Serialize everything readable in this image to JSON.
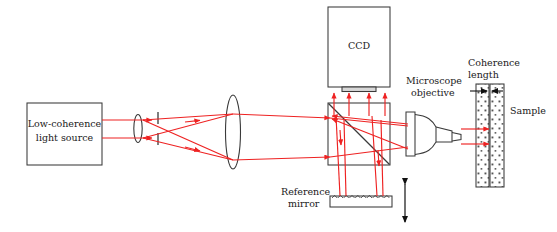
{
  "figure": {
    "type": "optical-schematic",
    "background_color": "#ffffff",
    "ray_color": "#ee2222",
    "outline_color": "#3a3a3a",
    "text_color": "#1a1a1a"
  },
  "labels": {
    "light_source_line1": "Low-coherence",
    "light_source_line2": "light source",
    "ccd": "CCD",
    "microscope_objective_line1": "Microscope",
    "microscope_objective_line2": "objective",
    "coherence_length_line1": "Coherence",
    "coherence_length_line2": "length",
    "sample": "Sample",
    "reference_mirror_line1": "Reference",
    "reference_mirror_line2": "mirror"
  },
  "components": [
    {
      "name": "low-coherence-light-source",
      "kind": "box",
      "x": 27,
      "y": 103,
      "w": 75,
      "h": 62
    },
    {
      "name": "condenser-lens",
      "kind": "lens",
      "cx": 138,
      "cy": 128,
      "rx": 4,
      "ry": 14
    },
    {
      "name": "pinhole-aperture",
      "kind": "aperture",
      "x": 158,
      "cy": 128,
      "gap": 8,
      "h": 30
    },
    {
      "name": "collimating-lens",
      "kind": "lens",
      "cx": 233,
      "cy": 132,
      "rx": 8,
      "ry": 36
    },
    {
      "name": "ccd-camera",
      "kind": "box",
      "x": 328,
      "y": 7,
      "w": 62,
      "h": 80
    },
    {
      "name": "ccd-sensor-element",
      "kind": "bar",
      "x": 341,
      "y": 87,
      "w": 35,
      "h": 5
    },
    {
      "name": "beamsplitter-cube",
      "kind": "cube",
      "x": 328,
      "y": 103,
      "w": 62,
      "h": 62
    },
    {
      "name": "beamsplitter-diagonal",
      "kind": "line",
      "x1": 328,
      "y1": 103,
      "x2": 390,
      "y2": 165
    },
    {
      "name": "microscope-objective",
      "kind": "objective",
      "x": 406,
      "y": 112,
      "w": 55,
      "h": 44
    },
    {
      "name": "sample",
      "kind": "stippled-slab",
      "x": 476,
      "y": 84,
      "w": 28,
      "h": 103,
      "split_x": 490
    },
    {
      "name": "reference-mirror",
      "kind": "hatched-bar",
      "x": 330,
      "y": 196,
      "w": 62,
      "h": 11,
      "teeth": 11
    },
    {
      "name": "mirror-translation-arrow",
      "kind": "double-arrow",
      "x": 405,
      "y1": 182,
      "y2": 224
    },
    {
      "name": "coherence-length-arrows",
      "kind": "inward-arrows",
      "y": 91,
      "x1": 476,
      "x2": 497
    }
  ],
  "rays": {
    "description": "Red light rays from source through beamsplitter to sample arm and reference arm, returning to CCD",
    "segments": [
      {
        "name": "source-upper",
        "points": "102,120 158,120"
      },
      {
        "name": "source-lower",
        "points": "102,138 158,138"
      },
      {
        "name": "cross-upper",
        "points": "158,120 233,114"
      },
      {
        "name": "cross-lower",
        "points": "158,138 233,160"
      },
      {
        "name": "collimated-upper",
        "points": "233,114 328,118"
      },
      {
        "name": "collimated-lower",
        "points": "233,160 328,158"
      },
      {
        "name": "to-objective-upper",
        "points": "328,118 406,125"
      },
      {
        "name": "to-objective-lower",
        "points": "328,158 406,148"
      },
      {
        "name": "objective-to-sample-upper",
        "points": "461,128 492,128"
      },
      {
        "name": "objective-to-sample-lower",
        "points": "461,145 492,145"
      },
      {
        "name": "beamsplitter-to-ccd",
        "count": 4
      },
      {
        "name": "beamsplitter-to-reference-mirror",
        "count": 4
      }
    ]
  }
}
